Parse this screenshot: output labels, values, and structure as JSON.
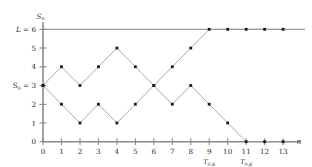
{
  "chart_data": {
    "type": "line",
    "title": "",
    "xlabel": "n",
    "ylabel": "S_n",
    "xlim": [
      0,
      13
    ],
    "ylim": [
      0,
      6
    ],
    "grid": false,
    "legend": "none",
    "x": [
      0,
      1,
      2,
      3,
      4,
      5,
      6,
      7,
      8,
      9,
      10,
      11,
      12,
      13
    ],
    "xticks": [
      "0",
      "1",
      "2",
      "3",
      "4",
      "5",
      "6",
      "7",
      "8",
      "9",
      "10",
      "11",
      "12",
      "13"
    ],
    "yticks": [
      "0",
      "1",
      "2",
      "3",
      "4",
      "5",
      "6"
    ],
    "series": [
      {
        "name": "path-absorbed-at-0",
        "x": [
          0,
          1,
          2,
          3,
          4,
          5,
          6,
          7,
          8,
          9,
          10,
          11,
          12,
          13
        ],
        "values": [
          3,
          4,
          3,
          4,
          5,
          4,
          3,
          2,
          3,
          2,
          1,
          0,
          0,
          0
        ]
      },
      {
        "name": "path-absorbed-at-6",
        "x": [
          0,
          1,
          2,
          3,
          4,
          5,
          6,
          7,
          8,
          9,
          10,
          11,
          12,
          13
        ],
        "values": [
          3,
          2,
          1,
          2,
          1,
          2,
          3,
          4,
          5,
          6,
          6,
          6,
          6,
          6
        ]
      }
    ],
    "barriers": [
      {
        "name": "upper-barrier",
        "value": 6,
        "label": "L = 6"
      },
      {
        "name": "lower-barrier",
        "value": 0
      }
    ],
    "annotations": [
      {
        "name": "start-value",
        "text": "S",
        "sub": "0",
        "suffix": " = 3",
        "y": 3
      },
      {
        "name": "stopping-time-upper",
        "text": "T",
        "sub": "0,6",
        "x": 9
      },
      {
        "name": "stopping-time-lower",
        "text": "T",
        "sub": "0,6",
        "x": 11
      }
    ]
  },
  "axes": {
    "y_axis_name": "S",
    "y_axis_name_sub": "n",
    "x_axis_name": "n",
    "y_tick_0": "0",
    "y_tick_1": "1",
    "y_tick_2": "2",
    "y_tick_3": "3",
    "y_tick_4": "4",
    "y_tick_5": "5",
    "y_tick_6": "6",
    "barrier_label_L": "L",
    "barrier_label_eq": " = 6",
    "start_label_S": "S",
    "start_label_sub": "0",
    "start_label_eq": " = 3",
    "x_tick_0": "0",
    "x_tick_1": "1",
    "x_tick_2": "2",
    "x_tick_3": "3",
    "x_tick_4": "4",
    "x_tick_5": "5",
    "x_tick_6": "6",
    "x_tick_7": "7",
    "x_tick_8": "8",
    "x_tick_9": "9",
    "x_tick_10": "10",
    "x_tick_11": "11",
    "x_tick_12": "12",
    "x_tick_13": "13",
    "stop_T": "T",
    "stop_sub": "0,6"
  },
  "colors": {
    "axis": "#8a8a8a",
    "line": "#a0a0a0",
    "dot": "#1a1a1a",
    "text": "#2b2b2b",
    "background": "#ffffff"
  }
}
